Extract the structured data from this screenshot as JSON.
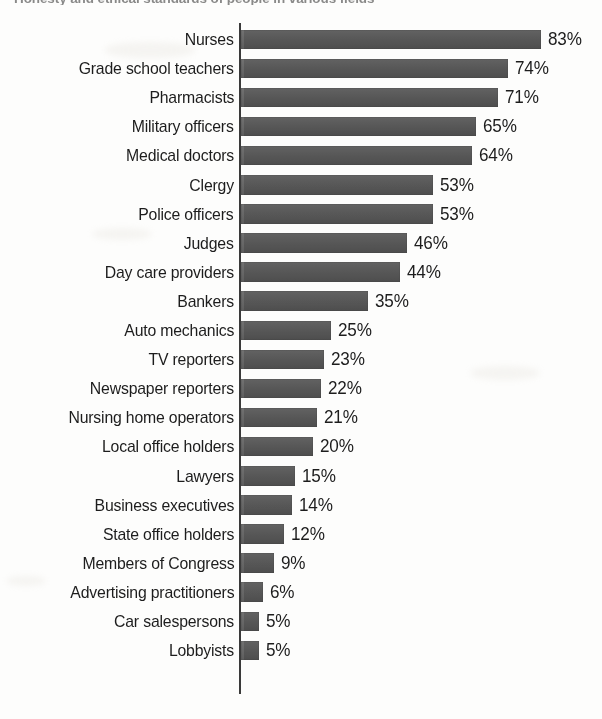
{
  "chart_data": {
    "type": "bar",
    "orientation": "horizontal",
    "title": "Honesty and ethical standards of people in various fields",
    "subtitle": "",
    "xlabel": "",
    "ylabel": "",
    "xlim": [
      0,
      83
    ],
    "grid": false,
    "legend": null,
    "value_suffix": "%",
    "bar_color": "#565656",
    "axis_color": "#3a3a3a",
    "background_color": "#fdfdfc",
    "categories": [
      "Nurses",
      "Grade school teachers",
      "Pharmacists",
      "Military officers",
      "Medical doctors",
      "Clergy",
      "Police officers",
      "Judges",
      "Day care providers",
      "Bankers",
      "Auto mechanics",
      "TV reporters",
      "Newspaper reporters",
      "Nursing home operators",
      "Local office holders",
      "Lawyers",
      "Business executives",
      "State office holders",
      "Members of Congress",
      "Advertising practitioners",
      "Car salespersons",
      "Lobbyists"
    ],
    "values": [
      83,
      74,
      71,
      65,
      64,
      53,
      53,
      46,
      44,
      35,
      25,
      23,
      22,
      21,
      20,
      15,
      14,
      12,
      9,
      6,
      5,
      5
    ],
    "value_labels": [
      "83%",
      "74%",
      "71%",
      "65%",
      "64%",
      "53%",
      "53%",
      "46%",
      "44%",
      "35%",
      "25%",
      "23%",
      "22%",
      "21%",
      "20%",
      "15%",
      "14%",
      "12%",
      "9%",
      "6%",
      "5%",
      "5%"
    ]
  }
}
